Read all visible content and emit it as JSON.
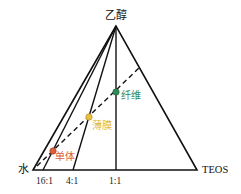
{
  "diagram": {
    "type": "ternary-phase-diagram",
    "vertices": {
      "top": "乙醇",
      "left": "水",
      "right": "TEOS"
    },
    "base_ratios": [
      "16:1",
      "4:1",
      "1:1"
    ],
    "points": [
      {
        "label": "单体",
        "color": "#d8603a"
      },
      {
        "label": "薄膜",
        "color": "#e8c040"
      },
      {
        "label": "纤维",
        "color": "#2e8b57"
      }
    ],
    "line_color": "#111111"
  }
}
